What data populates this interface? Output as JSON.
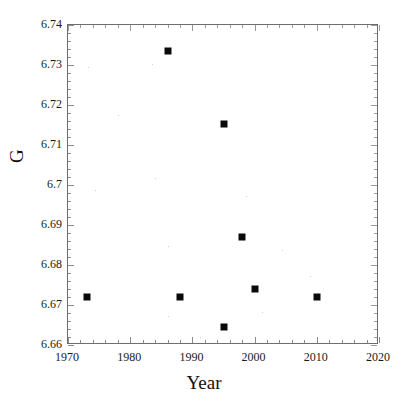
{
  "chart_data": {
    "type": "scatter",
    "title": "",
    "xlabel": "Year",
    "ylabel": "G",
    "xlim": [
      1970,
      2020
    ],
    "ylim": [
      6.66,
      6.74
    ],
    "grid": false,
    "legend": null,
    "x": [
      1973,
      1986,
      1988,
      1995,
      1995,
      1998,
      2000,
      2010
    ],
    "y": [
      6.672,
      6.7335,
      6.672,
      6.7152,
      6.6645,
      6.687,
      6.674,
      6.672
    ],
    "points": [
      {
        "x": 1973,
        "y": 6.672
      },
      {
        "x": 1986,
        "y": 6.7335
      },
      {
        "x": 1988,
        "y": 6.672
      },
      {
        "x": 1995,
        "y": 6.7152
      },
      {
        "x": 1995,
        "y": 6.6645
      },
      {
        "x": 1998,
        "y": 6.687
      },
      {
        "x": 2000,
        "y": 6.674
      },
      {
        "x": 2010,
        "y": 6.672
      }
    ],
    "marker": "filled-square",
    "marker_color": "#0a0a0a",
    "xticks": [
      1970,
      1980,
      1990,
      2000,
      2010,
      2020
    ],
    "xtick_labels": [
      "1970",
      "1980",
      "1990",
      "2000",
      "2010",
      "2020"
    ],
    "xtick_minor_step": 2,
    "yticks": [
      6.66,
      6.67,
      6.68,
      6.69,
      6.7,
      6.71,
      6.72,
      6.73,
      6.74
    ],
    "ytick_labels": [
      "6.66",
      "6.67",
      "6.68",
      "6.69",
      "6.7",
      "6.71",
      "6.72",
      "6.73",
      "6.74"
    ],
    "ytick_minor_step": 0.002
  },
  "axes": {
    "x_title": "Year",
    "y_title": "G"
  },
  "colors": {
    "background": "#ffffff",
    "frame": "#6e6e6e",
    "marker": "#0a0a0a",
    "text": "#111111"
  }
}
